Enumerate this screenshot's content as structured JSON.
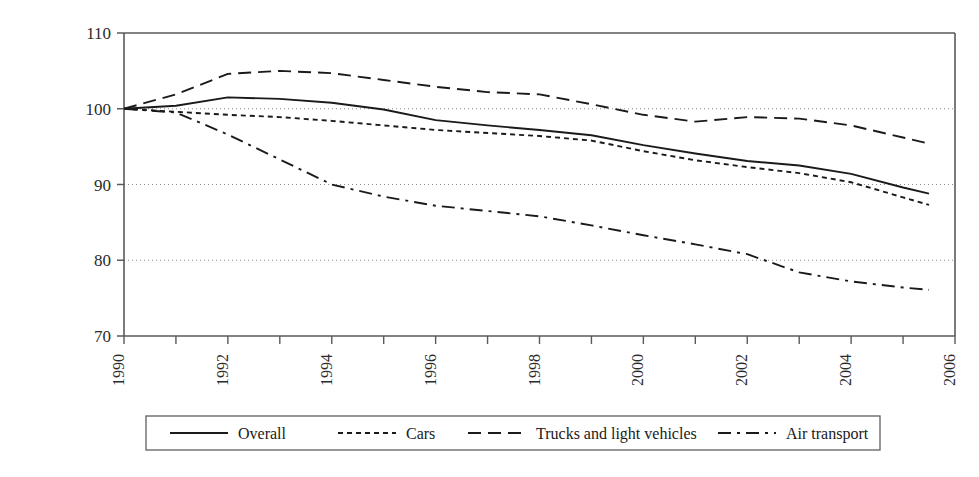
{
  "chart_data": {
    "type": "line",
    "title": "",
    "subtitle": "",
    "xlabel": "",
    "ylabel": "",
    "xlim": [
      1990,
      2006
    ],
    "ylim": [
      70,
      110
    ],
    "grid": "horizontal-dotted",
    "gridlines_y": [
      80,
      90,
      100
    ],
    "yticks": [
      70,
      80,
      90,
      100,
      110
    ],
    "ytick_labels": [
      "70",
      "80",
      "90",
      "100",
      "110"
    ],
    "xticks": [
      1990,
      1991,
      1992,
      1993,
      1994,
      1995,
      1996,
      1997,
      1998,
      1999,
      2000,
      2001,
      2002,
      2003,
      2004,
      2005,
      2006
    ],
    "xtick_labels_shown": [
      "1990",
      "1992",
      "1994",
      "1996",
      "1998",
      "2000",
      "2002",
      "2004",
      "2006"
    ],
    "xtick_label_rotation": -90,
    "legend_position": "bottom",
    "x": [
      1990,
      1991,
      1992,
      1993,
      1994,
      1995,
      1996,
      1997,
      1998,
      1999,
      2000,
      2001,
      2002,
      2003,
      2004,
      2005,
      2005.5
    ],
    "series": [
      {
        "name": "Overall",
        "style": "solid",
        "color": "#1a1a1a",
        "values": [
          100.0,
          100.4,
          101.5,
          101.3,
          100.8,
          99.9,
          98.5,
          97.8,
          97.2,
          96.5,
          95.2,
          94.1,
          93.1,
          92.5,
          91.4,
          89.6,
          88.8
        ]
      },
      {
        "name": "Cars",
        "style": "dotted",
        "color": "#1a1a1a",
        "values": [
          100.0,
          99.6,
          99.2,
          98.9,
          98.4,
          97.8,
          97.2,
          96.8,
          96.4,
          95.8,
          94.4,
          93.2,
          92.3,
          91.5,
          90.3,
          88.3,
          87.3
        ]
      },
      {
        "name": "Trucks and light vehicles",
        "style": "dashed",
        "color": "#1a1a1a",
        "values": [
          100.0,
          101.9,
          104.6,
          105.0,
          104.7,
          103.8,
          102.9,
          102.2,
          101.9,
          100.6,
          99.2,
          98.3,
          98.9,
          98.7,
          97.8,
          96.2,
          95.4
        ]
      },
      {
        "name": "Air transport",
        "style": "dashdot",
        "color": "#1a1a1a",
        "values": [
          100.0,
          99.5,
          96.6,
          93.3,
          90.0,
          88.4,
          87.2,
          86.5,
          85.8,
          84.6,
          83.3,
          82.1,
          80.8,
          78.4,
          77.2,
          76.4,
          76.1
        ]
      }
    ]
  },
  "axes": {
    "ytick_labels": [
      "110",
      "100",
      "90",
      "80",
      "70"
    ],
    "xtick_labels": [
      "1990",
      "1992",
      "1994",
      "1996",
      "1998",
      "2000",
      "2002",
      "2004",
      "2006"
    ]
  },
  "legend": {
    "entries": [
      {
        "label": "Overall",
        "style": "solid"
      },
      {
        "label": "Cars",
        "style": "dotted"
      },
      {
        "label": "Trucks and light vehicles",
        "style": "dashed"
      },
      {
        "label": "Air transport",
        "style": "dashdot"
      }
    ]
  },
  "style": {
    "axis_color": "#5a5a5a",
    "grid_color": "#8c8c8c",
    "line_color": "#1a1a1a",
    "legend_border": "#6b6b6b",
    "background": "#ffffff"
  }
}
